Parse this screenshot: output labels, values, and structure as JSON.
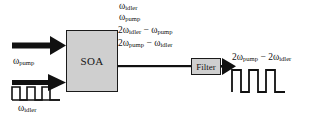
{
  "diagram": {
    "background_color": "#ffffff",
    "stroke_color": "#111111",
    "box_fill_color": "#cfcfcf",
    "blocks": {
      "soa": {
        "label": "SOA",
        "name": "semiconductor-optical-amplifier"
      },
      "filter": {
        "label": "Filter",
        "name": "optical-filter"
      }
    },
    "inputs": {
      "pump": {
        "label_plain": "ωpump",
        "omega": "ω",
        "subscript": "pump"
      },
      "idler": {
        "label_plain": "ωidler",
        "omega": "ω",
        "subscript": "idler",
        "pulse_count": 3
      }
    },
    "soa_output_components": [
      {
        "id": "comp-1",
        "text": "ωidler",
        "prefix": "",
        "omega": "ω",
        "subscript": "idler"
      },
      {
        "id": "comp-2",
        "text": "ωpump",
        "prefix": "",
        "omega": "ω",
        "subscript": "pump"
      },
      {
        "id": "comp-3",
        "text": "2ωidler − ωpump",
        "prefix": "2",
        "omega": "ω",
        "subscript": "idler"
      },
      {
        "id": "comp-4",
        "text": "2ωpump − ωidler",
        "prefix": "2",
        "omega": "ω",
        "subscript": "pump"
      }
    ],
    "output": {
      "label_plain": "2ωpump − 2ωidler",
      "pulse_count": 3
    },
    "text": {
      "soa_label": "SOA",
      "filter_label": "Filter",
      "pump_omega": "ω",
      "pump_sub": "pump",
      "idler_omega": "ω",
      "idler_sub": "idler",
      "line1_omega": "ω",
      "line1_sub": "idler",
      "line2_omega": "ω",
      "line2_sub": "pump",
      "line3_a": "2ω",
      "line3_a_sub": "idler",
      "line3_op": " − ω",
      "line3_b_sub": "pump",
      "line4_a": "2ω",
      "line4_a_sub": "pump",
      "line4_op": " − ω",
      "line4_b_sub": "idler",
      "out_a": "2ω",
      "out_a_sub": "pump",
      "out_op": " − 2ω",
      "out_b_sub": "idler"
    }
  }
}
